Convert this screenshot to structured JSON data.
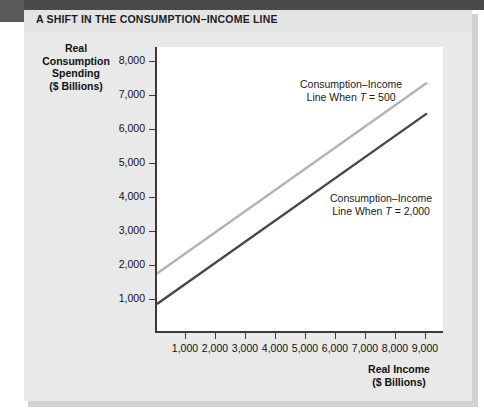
{
  "figure": {
    "title": "A SHIFT IN THE CONSUMPTION–INCOME LINE",
    "accent_color": "#4a4a4a",
    "panel_color": "#e9e9e9",
    "plot_background": "#ffffff"
  },
  "chart_data": {
    "type": "line",
    "title": "A SHIFT IN THE CONSUMPTION–INCOME LINE",
    "xlabel": "Real Income ($ Billions)",
    "ylabel": "Real Consumption Spending ($ Billions)",
    "xlim": [
      0,
      9600
    ],
    "ylim": [
      0,
      8400
    ],
    "xticks": [
      1000,
      2000,
      3000,
      4000,
      5000,
      6000,
      7000,
      8000,
      9000
    ],
    "xtick_labels": [
      "1,000",
      "2,000",
      "3,000",
      "4,000",
      "5,000",
      "6,000",
      "7,000",
      "8,000",
      "9,000"
    ],
    "yticks": [
      1000,
      2000,
      3000,
      4000,
      5000,
      6000,
      7000,
      8000
    ],
    "ytick_labels": [
      "1,000",
      "2,000",
      "3,000",
      "4,000",
      "5,000",
      "6,000",
      "7,000",
      "8,000"
    ],
    "grid": false,
    "legend_position": "inline-annotations",
    "series": [
      {
        "name": "Consumption–Income Line When T = 500",
        "color": "#b3b3b3",
        "x": [
          0,
          9000
        ],
        "values": [
          1750,
          7350
        ]
      },
      {
        "name": "Consumption–Income Line When T = 2,000",
        "color": "#474747",
        "x": [
          0,
          9000
        ],
        "values": [
          850,
          6450
        ]
      }
    ],
    "annotations": [
      {
        "id": "upper-line-label",
        "line1": "Consumption–Income",
        "line2_prefix": "Line When ",
        "line2_italic": "T",
        "line2_suffix": " = 500"
      },
      {
        "id": "lower-line-label",
        "line1": "Consumption–Income",
        "line2_prefix": "Line When ",
        "line2_italic": "T",
        "line2_suffix": " = 2,000"
      }
    ]
  },
  "ylabel_lines": [
    "Real",
    "Consumption",
    "Spending",
    "($ Billions)"
  ],
  "xlabel_lines": [
    "Real Income",
    "($ Billions)"
  ]
}
